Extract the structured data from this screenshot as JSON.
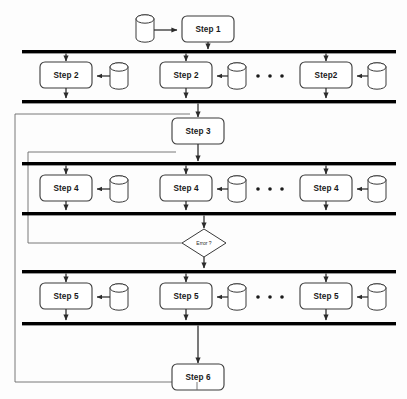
{
  "diagram": {
    "width": 407,
    "height": 399,
    "background_color": "#fdfdfd",
    "line_color": "#2b2b2b",
    "box_fill": "#ffffff",
    "sync_bar_color": "#000000",
    "loop_line_color": "#6a6a6a"
  },
  "nodes": {
    "step1": {
      "label": "Step 1",
      "shape": "rounded-rect",
      "x": 182,
      "y": 16,
      "w": 52,
      "h": 26
    },
    "step3": {
      "label": "Step 3",
      "shape": "rounded-rect",
      "x": 172,
      "y": 118,
      "w": 52,
      "h": 26
    },
    "step6": {
      "label": "Step 6",
      "shape": "rounded-rect",
      "x": 172,
      "y": 364,
      "w": 52,
      "h": 26
    },
    "decision": {
      "label": "Error ?",
      "shape": "diamond",
      "cx": 204,
      "cy": 243,
      "rx": 22,
      "ry": 14
    }
  },
  "rows": [
    {
      "id": "row-step2",
      "label": "Step 2 parallel row",
      "top_bar_y": 50,
      "bottom_bar_y": 100,
      "boxes": [
        {
          "label": "Step 2",
          "x": 40,
          "y": 62,
          "w": 52,
          "h": 26,
          "db_x": 110,
          "db_y": 63
        },
        {
          "label": "Step 2",
          "x": 160,
          "y": 62,
          "w": 52,
          "h": 26,
          "db_x": 228,
          "db_y": 63
        },
        {
          "label": "Step2",
          "x": 300,
          "y": 62,
          "w": 52,
          "h": 26,
          "db_x": 368,
          "db_y": 63
        }
      ],
      "ellipsis": {
        "x": 258,
        "y": 76,
        "count": 3
      }
    },
    {
      "id": "row-step4",
      "label": "Step 4 parallel row",
      "top_bar_y": 162,
      "bottom_bar_y": 212,
      "boxes": [
        {
          "label": "Step 4",
          "x": 40,
          "y": 175,
          "w": 52,
          "h": 26,
          "db_x": 110,
          "db_y": 176
        },
        {
          "label": "Step 4",
          "x": 160,
          "y": 175,
          "w": 52,
          "h": 26,
          "db_x": 228,
          "db_y": 176
        },
        {
          "label": "Step 4",
          "x": 300,
          "y": 175,
          "w": 52,
          "h": 26,
          "db_x": 368,
          "db_y": 176
        }
      ],
      "ellipsis": {
        "x": 258,
        "y": 189,
        "count": 3
      }
    },
    {
      "id": "row-step5",
      "label": "Step 5 parallel row",
      "top_bar_y": 270,
      "bottom_bar_y": 322,
      "boxes": [
        {
          "label": "Step 5",
          "x": 40,
          "y": 283,
          "w": 52,
          "h": 26,
          "db_x": 110,
          "db_y": 284
        },
        {
          "label": "Step 5",
          "x": 160,
          "y": 283,
          "w": 52,
          "h": 26,
          "db_x": 228,
          "db_y": 284
        },
        {
          "label": "Step 5",
          "x": 300,
          "y": 283,
          "w": 52,
          "h": 26,
          "db_x": 368,
          "db_y": 284
        }
      ],
      "ellipsis": {
        "x": 258,
        "y": 297,
        "count": 3
      }
    }
  ],
  "sync_bars": {
    "x_start": 22,
    "x_end": 396,
    "thickness": 3.4,
    "count": 6
  },
  "datastore": {
    "icon_name": "database-cylinder-icon",
    "w": 18,
    "h": 24,
    "count": 10
  },
  "loops": [
    {
      "id": "outer-loop",
      "label": "Step 6 back to Step 3 loop",
      "x": 15,
      "top_y": 114,
      "bottom_y": 382,
      "right_x": 197
    },
    {
      "id": "inner-loop",
      "label": "Error retry loop to Step 4 row",
      "x": 28,
      "top_y": 152,
      "bottom_y": 243,
      "right_x": 182
    }
  ],
  "legend_text": {
    "ellipsis_meaning": "...",
    "step1": "Step 1",
    "step2": "Step 2",
    "step2_nospace": "Step2",
    "step3": "Step 3",
    "step4": "Step 4",
    "step5": "Step 5",
    "step6": "Step 6",
    "error_decision": "Error ?"
  }
}
